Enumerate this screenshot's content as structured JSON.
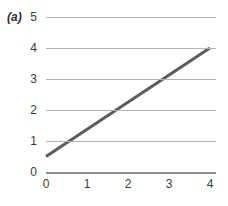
{
  "figure": {
    "panel_label": "(a)",
    "background_color": "#ffffff"
  },
  "chart_data": {
    "type": "line",
    "title": "",
    "subtitle": "",
    "xlabel": "",
    "ylabel": "",
    "annotations": [
      "(a)"
    ],
    "grid": true,
    "grid_axis": "y",
    "grid_color": "#b4b4b4",
    "legend": false,
    "legend_position": "none",
    "xlim": [
      0,
      4.15
    ],
    "ylim": [
      0,
      5
    ],
    "xticks": [
      0,
      1,
      2,
      3,
      4
    ],
    "xtick_labels": [
      "0",
      "1",
      "2",
      "3",
      "4"
    ],
    "yticks": [
      0,
      1,
      2,
      3,
      4,
      5
    ],
    "ytick_labels": [
      "0",
      "1",
      "2",
      "3",
      "4",
      "5"
    ],
    "series": [
      {
        "name": "line",
        "color": "#5c5c5c",
        "line_width": 3,
        "x": [
          0,
          4
        ],
        "y": [
          0.5,
          4.0
        ],
        "slope": 0.875,
        "intercept": 0.5
      }
    ]
  }
}
